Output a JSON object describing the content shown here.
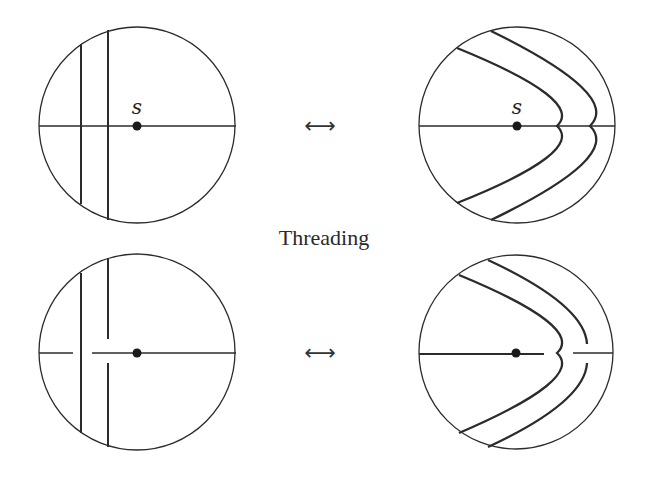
{
  "caption": "Threading",
  "point_label": "s",
  "arrow_symbol": "⟷",
  "colors": {
    "stroke": "#2b2b2b",
    "background": "#ffffff"
  },
  "panels": [
    {
      "id": "top-left",
      "description": "Two vertical arcs crossing the horizontal diameter; point s on diameter",
      "label": "s"
    },
    {
      "id": "top-right",
      "description": "Two nested arcs bent around point s, crossing the diameter",
      "label": "s"
    },
    {
      "id": "bottom-left",
      "description": "Vertical arcs with crossing breaks at the horizontal diameter",
      "label": ""
    },
    {
      "id": "bottom-right",
      "description": "Threaded arcs with horizontal diameter broken around the inner arc",
      "label": ""
    }
  ]
}
